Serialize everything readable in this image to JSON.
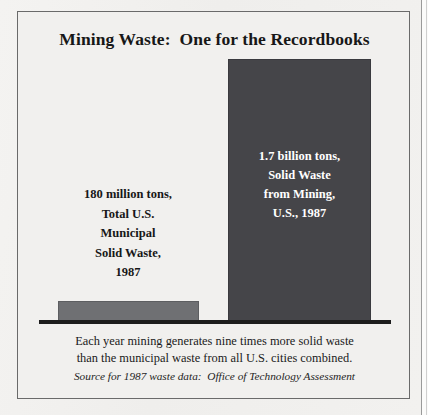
{
  "figure": {
    "title": "Mining Waste:  One for the Recordbooks",
    "caption_lines": [
      "Each year mining generates nine times more solid waste",
      "than the municipal waste from all U.S. cities combined."
    ],
    "source": "Source for 1987 waste data:  Office of Technology Assessment"
  },
  "colors": {
    "page": "#f1f0ee",
    "frame": "#6a6a6a",
    "bar_mining": "#454549",
    "bar_municipal": "#6f7073",
    "baseline": "#1d1d1d",
    "text_dark": "#171717",
    "text_light": "#ffffff"
  },
  "labels": {
    "municipal_lines": [
      "180 million tons,",
      "Total U.S.",
      "Municipal",
      "Solid Waste,",
      "1987"
    ],
    "mining_lines": [
      "1.7 billion tons,",
      "Solid Waste",
      "from Mining,",
      "U.S., 1987"
    ]
  },
  "chart_data": {
    "type": "bar",
    "title": "Mining Waste:  One for the Recordbooks",
    "categories": [
      "Total U.S. Municipal Solid Waste, 1987",
      "Solid Waste from Mining, U.S., 1987"
    ],
    "values": [
      180,
      1700
    ],
    "value_labels": [
      "180 million tons",
      "1.7 billion tons"
    ],
    "units": "million tons",
    "xlabel": "",
    "ylabel": "",
    "ylim": [
      0,
      1700
    ],
    "grid": false,
    "legend": false,
    "annotations": [
      "Each year mining generates nine times more solid waste than the municipal waste from all U.S. cities combined."
    ],
    "source": "Office of Technology Assessment"
  }
}
